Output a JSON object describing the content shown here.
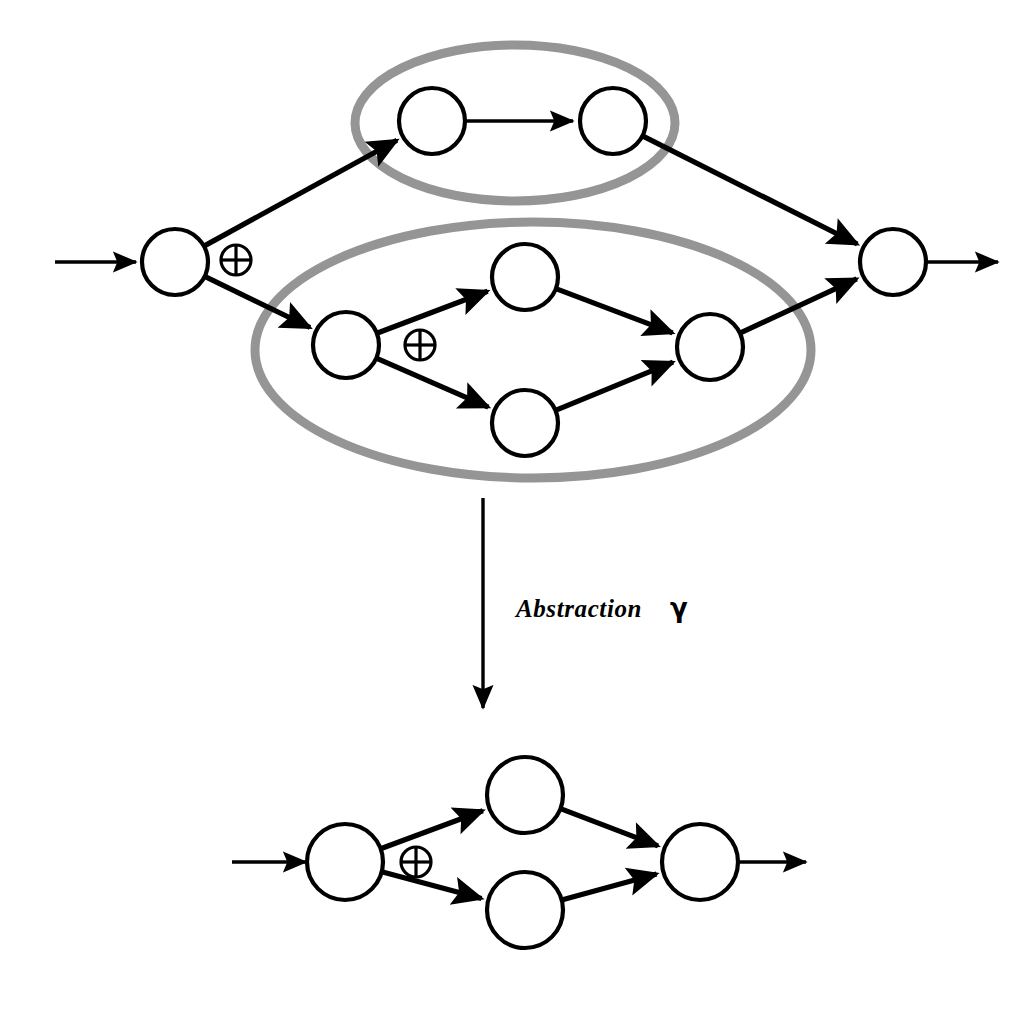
{
  "figure": {
    "background_color": "#ffffff",
    "stroke_color": "#000000",
    "group_outline_color": "#8c8c8c",
    "node_fill": "#ffffff"
  },
  "labels": {
    "transform_label": "Abstraction",
    "transform_symbol": "γ",
    "xor_glyph": "⊕"
  },
  "upper_graph": {
    "name": "concrete-graph",
    "entry_arrow": {
      "from_x": 55,
      "from_y": 262,
      "to_x": 136,
      "to_y": 262
    },
    "exit_arrow": {
      "from_x": 927,
      "from_y": 262,
      "to_x": 998,
      "to_y": 262
    },
    "nodes": [
      {
        "id": "n_src",
        "cx": 175,
        "cy": 262,
        "r": 33,
        "role": "source"
      },
      {
        "id": "n_t1",
        "cx": 432,
        "cy": 121,
        "r": 33,
        "role": "task",
        "group": "g_top"
      },
      {
        "id": "n_t2",
        "cx": 613,
        "cy": 121,
        "r": 33,
        "role": "task",
        "group": "g_top"
      },
      {
        "id": "n_b_src",
        "cx": 346,
        "cy": 345,
        "r": 33,
        "role": "sub-source",
        "group": "g_bottom"
      },
      {
        "id": "n_b_up",
        "cx": 525,
        "cy": 277,
        "r": 33,
        "role": "task",
        "group": "g_bottom"
      },
      {
        "id": "n_b_dn",
        "cx": 525,
        "cy": 423,
        "r": 33,
        "role": "task",
        "group": "g_bottom"
      },
      {
        "id": "n_b_jn",
        "cx": 710,
        "cy": 347,
        "r": 33,
        "role": "sub-sink",
        "group": "g_bottom"
      },
      {
        "id": "n_snk",
        "cx": 893,
        "cy": 262,
        "r": 33,
        "role": "sink"
      }
    ],
    "xor_markers": [
      {
        "id": "x_outer",
        "cx": 236,
        "cy": 260,
        "r": 15
      },
      {
        "id": "x_inner",
        "cx": 420,
        "cy": 345,
        "r": 15
      }
    ],
    "groups": [
      {
        "id": "g_top",
        "cx": 515,
        "cy": 123,
        "rx": 160,
        "ry": 78,
        "label": "composite-task-top"
      },
      {
        "id": "g_bottom",
        "cx": 533,
        "cy": 350,
        "rx": 278,
        "ry": 128,
        "label": "composite-task-bottom"
      }
    ],
    "edges": [
      {
        "from": "n_src",
        "to": "n_t1",
        "thick": true
      },
      {
        "from": "n_t1",
        "to": "n_t2",
        "thick": false
      },
      {
        "from": "n_t2",
        "to": "n_snk",
        "thick": true
      },
      {
        "from": "n_src",
        "to": "n_b_src",
        "thick": true
      },
      {
        "from": "n_b_src",
        "to": "n_b_up",
        "thick": true
      },
      {
        "from": "n_b_src",
        "to": "n_b_dn",
        "thick": true
      },
      {
        "from": "n_b_up",
        "to": "n_b_jn",
        "thick": true
      },
      {
        "from": "n_b_dn",
        "to": "n_b_jn",
        "thick": true
      },
      {
        "from": "n_b_jn",
        "to": "n_snk",
        "thick": true
      }
    ]
  },
  "transform_arrow": {
    "name": "abstraction-arrow",
    "from_x": 483,
    "from_y": 498,
    "to_x": 483,
    "to_y": 718,
    "label_x": 516,
    "label_y": 617
  },
  "lower_graph": {
    "name": "abstract-graph",
    "entry_arrow": {
      "from_x": 232,
      "from_y": 862,
      "to_x": 306,
      "to_y": 862
    },
    "exit_arrow": {
      "from_x": 735,
      "from_y": 862,
      "to_x": 806,
      "to_y": 862
    },
    "nodes": [
      {
        "id": "a_src",
        "cx": 345,
        "cy": 862,
        "r": 38,
        "role": "source"
      },
      {
        "id": "a_up",
        "cx": 525,
        "cy": 795,
        "r": 38,
        "role": "task"
      },
      {
        "id": "a_dn",
        "cx": 525,
        "cy": 910,
        "r": 38,
        "role": "task"
      },
      {
        "id": "a_snk",
        "cx": 700,
        "cy": 862,
        "r": 38,
        "role": "sink"
      }
    ],
    "xor_markers": [
      {
        "id": "a_xor",
        "cx": 416,
        "cy": 862,
        "r": 15
      }
    ],
    "edges": [
      {
        "from": "a_src",
        "to": "a_up",
        "thick": true
      },
      {
        "from": "a_src",
        "to": "a_dn",
        "thick": true
      },
      {
        "from": "a_up",
        "to": "a_snk",
        "thick": true
      },
      {
        "from": "a_dn",
        "to": "a_snk",
        "thick": true
      }
    ]
  }
}
